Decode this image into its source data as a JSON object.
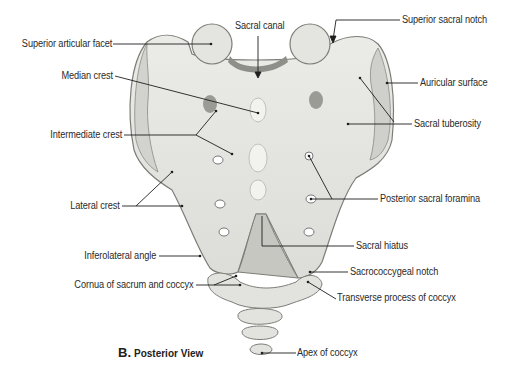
{
  "figure": {
    "panel_letter": "B.",
    "panel_title": "Posterior View",
    "subject": "Sacrum and coccyx",
    "colors": {
      "bone_fill": "#e9e9e6",
      "bone_shadow": "#c9c9c5",
      "bone_outline": "#7d7d78",
      "leader_line": "#1e1e1e",
      "label_text": "#2a2a2a",
      "background": "#ffffff"
    },
    "labels": {
      "superior_articular_facet": "Superior articular facet",
      "sacral_canal": "Sacral canal",
      "superior_sacral_notch": "Superior sacral notch",
      "median_crest": "Median crest",
      "auricular_surface": "Auricular surface",
      "sacral_tuberosity": "Sacral tuberosity",
      "intermediate_crest": "Intermediate crest",
      "lateral_crest": "Lateral crest",
      "posterior_sacral_foramina": "Posterior sacral foramina",
      "sacral_hiatus": "Sacral hiatus",
      "inferolateral_angle": "Inferolateral angle",
      "sacrococcygeal_notch": "Sacrococcygeal notch",
      "cornua": "Cornua of sacrum and coccyx",
      "transverse_process_coccyx": "Transverse process of coccyx",
      "apex_of_coccyx": "Apex of coccyx"
    }
  }
}
